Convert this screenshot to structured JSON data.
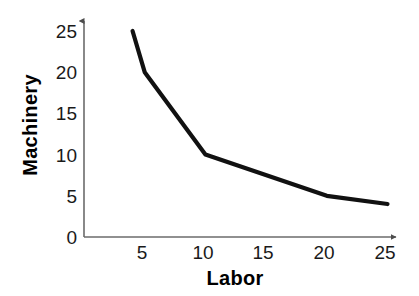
{
  "chart_data": {
    "type": "line",
    "title": "",
    "subtitle": "",
    "xlabel": "Labor",
    "ylabel": "Machinery",
    "x": [
      4,
      5,
      10,
      20,
      25
    ],
    "values": [
      25,
      20,
      10,
      5,
      4
    ],
    "series": [
      {
        "name": "isoquant",
        "x": [
          4,
          5,
          10,
          20,
          25
        ],
        "values": [
          25,
          20,
          10,
          5,
          4
        ]
      }
    ],
    "xlim": [
      0,
      27.5
    ],
    "ylim": [
      0,
      26.5
    ],
    "xticks": [
      5,
      10,
      15,
      20,
      25
    ],
    "yticks": [
      0,
      5,
      10,
      15,
      20,
      25
    ],
    "xtick_labels": [
      "5",
      "10",
      "15",
      "20",
      "25"
    ],
    "ytick_labels": [
      "0",
      "5",
      "10",
      "15",
      "20",
      "25"
    ],
    "grid": false,
    "legend": false,
    "legend_position": "none",
    "annotations": [],
    "line_color": "#111111",
    "axis_color": "#6b6b6b",
    "background_color": "#ffffff",
    "x_axis_arrow": true,
    "y_axis_arrow": true
  },
  "axis": {
    "y_labels": [
      "25",
      "20",
      "15",
      "10",
      "5",
      "0"
    ],
    "x_labels": [
      "5",
      "10",
      "15",
      "20",
      "25"
    ],
    "x_title": "Labor",
    "y_title": "Machinery"
  }
}
